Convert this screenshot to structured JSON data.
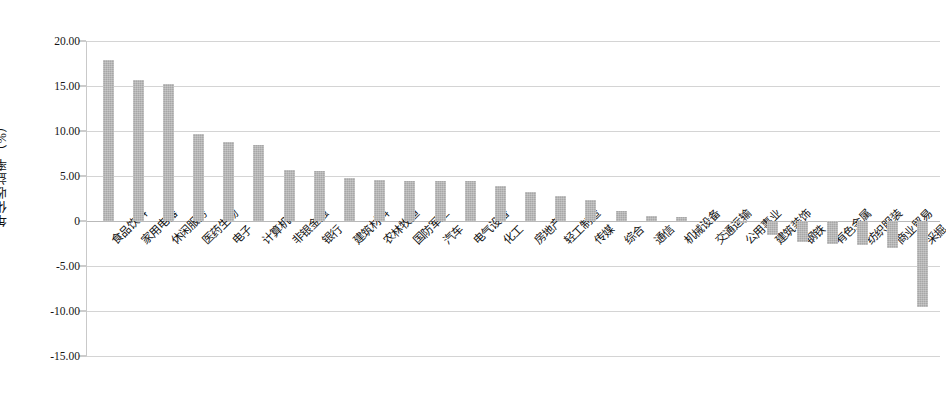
{
  "chart_data": {
    "type": "bar",
    "title": "",
    "xlabel": "",
    "ylabel": "年化收益率（%）",
    "ylim": [
      -15.0,
      20.0
    ],
    "ytick_labels": [
      "20.00",
      "15.00",
      "10.00",
      "5.00",
      "0",
      "-5.00",
      "-10.00",
      "-15.00"
    ],
    "ytick_values": [
      20.0,
      15.0,
      10.0,
      5.0,
      0,
      -5.0,
      -10.0,
      -15.0
    ],
    "grid": true,
    "legend": "none",
    "bar_color": "#a7a7a7",
    "categories": [
      "食品饮料",
      "家用电器",
      "休闲服务",
      "医药生物",
      "电子",
      "计算机",
      "非银金融",
      "银行",
      "建筑材料",
      "农林牧渔",
      "国防军工",
      "汽车",
      "电气设备",
      "化工",
      "房地产",
      "轻工制造",
      "传媒",
      "综合",
      "通信",
      "机械设备",
      "交通运输",
      "公用事业",
      "建筑装饰",
      "钢铁",
      "有色金属",
      "纺织服装",
      "商业贸易",
      "采掘"
    ],
    "values": [
      17.9,
      15.7,
      15.2,
      9.7,
      8.8,
      8.4,
      5.7,
      5.6,
      4.8,
      4.6,
      4.5,
      4.5,
      4.4,
      3.9,
      3.2,
      2.8,
      2.3,
      1.1,
      0.6,
      0.5,
      -0.1,
      -0.2,
      -1.6,
      -2.3,
      -2.6,
      -2.7,
      -3.0,
      -9.6
    ]
  }
}
